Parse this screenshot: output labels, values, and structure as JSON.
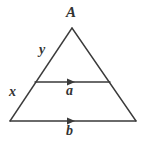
{
  "figure": {
    "kind": "geometry-diagram",
    "background_color": "#ffffff",
    "stroke_color": "#3a3a3a",
    "label_color": "#333333",
    "stroke_width": 1.4,
    "canvas": {
      "width": 145,
      "height": 144
    }
  },
  "labels": {
    "apex": "A",
    "upper_left_side": "y",
    "lower_left_side": "x",
    "midsegment": "a",
    "base": "b"
  },
  "geometry": {
    "triangle": {
      "apex": {
        "x": 72,
        "y": 28
      },
      "bottom_left": {
        "x": 10,
        "y": 121
      },
      "bottom_right": {
        "x": 136,
        "y": 121
      }
    },
    "midsegment": {
      "left": {
        "x": 35,
        "y": 82
      },
      "right": {
        "x": 110,
        "y": 82
      },
      "arrow_direction": "right",
      "arrow_at": {
        "x": 72,
        "y": 82
      }
    },
    "base": {
      "left": {
        "x": 10,
        "y": 121
      },
      "right": {
        "x": 136,
        "y": 121
      },
      "arrow_direction": "right",
      "arrow_at": {
        "x": 72,
        "y": 121
      }
    }
  }
}
